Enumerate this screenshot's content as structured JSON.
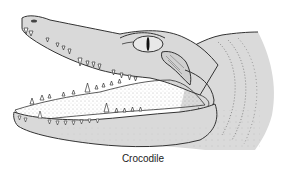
{
  "figure": {
    "caption": "Crocodile",
    "colors": {
      "background": "#ffffff",
      "skin_fill": "#d9d9d9",
      "outline": "#333333",
      "teeth": "#ffffff",
      "stipple": "#777777"
    }
  }
}
